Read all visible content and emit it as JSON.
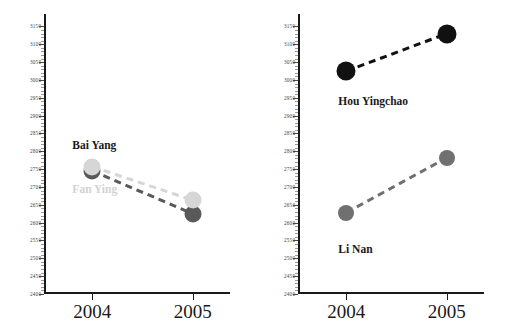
{
  "chart_data": [
    {
      "type": "line",
      "panel": "left",
      "title": "",
      "xlabel": "",
      "ylabel": "",
      "categories": [
        "2004",
        "2005"
      ],
      "xtick_labels": [
        "2004",
        "2005"
      ],
      "ytick_labels": [
        "2400",
        "2450",
        "2500",
        "2550",
        "2600",
        "2650",
        "2700",
        "2750",
        "2800",
        "2850",
        "2900",
        "2950",
        "3000",
        "3050",
        "3100",
        "3150"
      ],
      "ytick_values": [
        2400,
        2450,
        2500,
        2550,
        2600,
        2650,
        2700,
        2750,
        2800,
        2850,
        2900,
        2950,
        3000,
        3050,
        3100,
        3150
      ],
      "ylim": [
        2400,
        3185
      ],
      "ytick_step": 50,
      "minor_ticks": true,
      "grid": false,
      "legend": "inline-labels",
      "series": [
        {
          "name": "Bai Yang",
          "label": "Bai Yang",
          "values": [
            2745,
            2625
          ],
          "color": "#595959",
          "label_color": "#1a1a1a",
          "line_style": "dashed"
        },
        {
          "name": "Fan Ying",
          "label": "Fan Ying",
          "values": [
            2757,
            2663
          ],
          "color": "#d6d6d6",
          "label_color": "#d2d2d2",
          "line_style": "dashed"
        }
      ]
    },
    {
      "type": "line",
      "panel": "right",
      "title": "",
      "xlabel": "",
      "ylabel": "",
      "categories": [
        "2004",
        "2005"
      ],
      "xtick_labels": [
        "2004",
        "2005"
      ],
      "ytick_labels": [
        "2400",
        "2450",
        "2500",
        "2550",
        "2600",
        "2650",
        "2700",
        "2750",
        "2800",
        "2850",
        "2900",
        "2950",
        "3000",
        "3050",
        "3100",
        "3150"
      ],
      "ytick_values": [
        2400,
        2450,
        2500,
        2550,
        2600,
        2650,
        2700,
        2750,
        2800,
        2850,
        2900,
        2950,
        3000,
        3050,
        3100,
        3150
      ],
      "ylim": [
        2400,
        3185
      ],
      "ytick_step": 50,
      "minor_ticks": true,
      "grid": false,
      "legend": "inline-labels",
      "series": [
        {
          "name": "Hou Yingchao",
          "label": "Hou Yingchao",
          "values": [
            3025,
            3130
          ],
          "color": "#111111",
          "label_color": "#1a1a1a",
          "line_style": "dashed"
        },
        {
          "name": "Li Nan",
          "label": "Li Nan",
          "values": [
            2628,
            2782
          ],
          "color": "#707070",
          "label_color": "#1a1a1a",
          "line_style": "dashed"
        }
      ]
    }
  ],
  "figure": {
    "background": "#ffffff",
    "axis_color": "#1a1a1a",
    "panels": 2
  }
}
